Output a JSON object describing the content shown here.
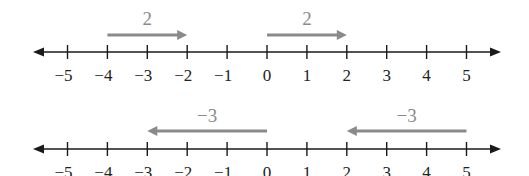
{
  "diagram": {
    "type": "number-line-addition",
    "colors": {
      "axis": "#1a1a1a",
      "jump_arrow": "#8a8a8a",
      "jump_label": "#8a8a8a",
      "tick_label": "#222222"
    },
    "number_lines": [
      {
        "id": "top",
        "axis_y": 52,
        "label_y": 81,
        "arrow_y": 35,
        "jump_label_y": 25,
        "ticks": [
          -5,
          -4,
          -3,
          -2,
          -1,
          0,
          1,
          2,
          3,
          4,
          5
        ],
        "tick_labels": [
          "−5",
          "−4",
          "−3",
          "−2",
          "−1",
          "0",
          "1",
          "2",
          "3",
          "4",
          "5"
        ],
        "jumps": [
          {
            "from": -4,
            "to": -2,
            "label": "2"
          },
          {
            "from": 0,
            "to": 2,
            "label": "2"
          }
        ]
      },
      {
        "id": "bottom",
        "axis_y": 149,
        "label_y": 178,
        "arrow_y": 131,
        "jump_label_y": 122,
        "ticks": [
          -5,
          -4,
          -3,
          -2,
          -1,
          0,
          1,
          2,
          3,
          4,
          5
        ],
        "tick_labels": [
          "−5",
          "−4",
          "−3",
          "−2",
          "−1",
          "0",
          "1",
          "2",
          "3",
          "4",
          "5"
        ],
        "jumps": [
          {
            "from": 0,
            "to": -3,
            "label": "−3"
          },
          {
            "from": 5,
            "to": 2,
            "label": "−3"
          }
        ]
      }
    ]
  }
}
